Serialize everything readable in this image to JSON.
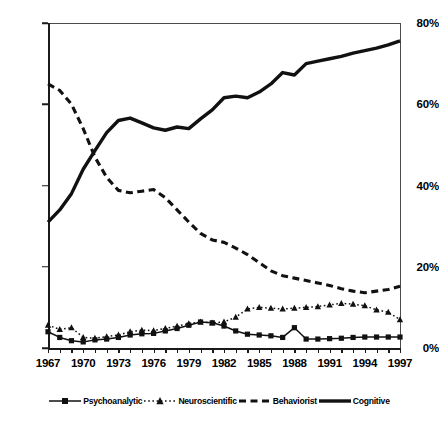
{
  "chart_data": {
    "type": "line",
    "title": "",
    "subtitle": "",
    "xlabel": "",
    "ylabel": "",
    "xlim": [
      1967,
      1997
    ],
    "ylim": [
      0,
      80
    ],
    "yticks": [
      0,
      20,
      40,
      60,
      80
    ],
    "ytick_labels": [
      "0%",
      "20%",
      "40%",
      "60%",
      "80%"
    ],
    "xticks": [
      1967,
      1968,
      1969,
      1970,
      1971,
      1972,
      1973,
      1974,
      1975,
      1976,
      1977,
      1978,
      1979,
      1980,
      1981,
      1982,
      1983,
      1984,
      1985,
      1986,
      1987,
      1988,
      1989,
      1990,
      1991,
      1992,
      1993,
      1994,
      1995,
      1996,
      1997
    ],
    "xtick_labels": [
      "1967",
      "1970",
      "1973",
      "1976",
      "1979",
      "1982",
      "1985",
      "1988",
      "1991",
      "1994",
      "1997"
    ],
    "xtick_labeled_values": [
      1967,
      1970,
      1973,
      1976,
      1979,
      1982,
      1985,
      1988,
      1991,
      1994,
      1997
    ],
    "grid": false,
    "legend_position": "bottom",
    "x": [
      1967,
      1968,
      1969,
      1970,
      1971,
      1972,
      1973,
      1974,
      1975,
      1976,
      1977,
      1978,
      1979,
      1980,
      1981,
      1982,
      1983,
      1984,
      1985,
      1986,
      1987,
      1988,
      1989,
      1990,
      1991,
      1992,
      1993,
      1994,
      1995,
      1996,
      1997
    ],
    "series": [
      {
        "name": "Psychoanalytic",
        "style": "solid",
        "marker": "square",
        "color": "#111111",
        "values": [
          4.0,
          2.6,
          1.8,
          1.5,
          2.0,
          2.2,
          2.6,
          3.2,
          3.5,
          3.6,
          4.2,
          4.8,
          5.6,
          6.4,
          6.2,
          5.4,
          4.2,
          3.4,
          3.2,
          3.0,
          2.6,
          5.0,
          2.2,
          2.2,
          2.3,
          2.4,
          2.6,
          2.7,
          2.7,
          2.7,
          2.7
        ]
      },
      {
        "name": "Neuroscientific",
        "style": "dotted",
        "marker": "triangle",
        "color": "#111111",
        "values": [
          5.6,
          4.6,
          5.0,
          2.6,
          2.4,
          2.8,
          3.2,
          4.0,
          4.4,
          4.3,
          4.8,
          5.4,
          6.0,
          6.4,
          6.2,
          6.4,
          7.6,
          9.6,
          10.0,
          9.8,
          9.6,
          9.8,
          10.0,
          10.2,
          10.6,
          11.0,
          10.8,
          10.4,
          9.4,
          8.8,
          7.0
        ]
      },
      {
        "name": "Behaviorist",
        "style": "dashed",
        "marker": "none",
        "color": "#111111",
        "values": [
          65.0,
          63.4,
          60.0,
          54.0,
          47.0,
          42.0,
          38.8,
          38.2,
          38.6,
          39.0,
          37.0,
          34.0,
          31.0,
          28.2,
          26.6,
          26.0,
          24.6,
          23.0,
          21.0,
          19.0,
          17.8,
          17.2,
          16.6,
          16.0,
          15.4,
          14.6,
          14.0,
          13.6,
          14.0,
          14.4,
          15.2
        ]
      },
      {
        "name": "Cognitive",
        "style": "solid-thick",
        "marker": "none",
        "color": "#111111",
        "values": [
          31.0,
          34.0,
          38.0,
          44.0,
          48.6,
          53.0,
          56.0,
          56.6,
          55.4,
          54.2,
          53.6,
          54.4,
          54.0,
          56.4,
          58.6,
          61.6,
          62.0,
          61.6,
          63.0,
          65.0,
          67.8,
          67.2,
          70.0,
          70.6,
          71.2,
          71.8,
          72.6,
          73.2,
          73.8,
          74.6,
          75.6
        ]
      }
    ]
  },
  "legend": {
    "entries": [
      {
        "label": "Psychoanalytic",
        "key": "line-square-key"
      },
      {
        "label": "Neuroscientific",
        "key": "dotted-triangle-key"
      },
      {
        "label": "Behaviorist",
        "key": "dashed-key"
      },
      {
        "label": "Cognitive",
        "key": "thick-line-key"
      }
    ]
  }
}
